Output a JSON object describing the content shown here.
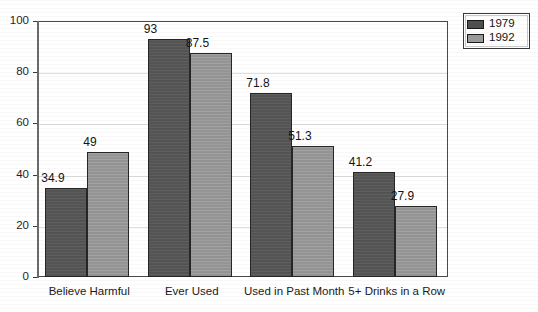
{
  "chart_data": {
    "type": "bar",
    "title": "",
    "subtitle": "",
    "xlabel": "",
    "ylabel": "",
    "ylim": [
      0,
      100
    ],
    "yticks": [
      0,
      20,
      40,
      60,
      80,
      100
    ],
    "ytick_labels": [
      "0",
      "20",
      "40",
      "60",
      "80",
      "100"
    ],
    "grid": true,
    "grid_axis": "y",
    "legend_position": "top-right",
    "categories": [
      "Believe Harmful",
      "Ever Used",
      "Used in Past Month",
      "5+ Drinks in a Row"
    ],
    "series": [
      {
        "name": "1979",
        "color": "#585858",
        "values": [
          34.9,
          93,
          71.8,
          41.2
        ],
        "value_labels": [
          "34.9",
          "93",
          "71.8",
          "41.2"
        ]
      },
      {
        "name": "1992",
        "color": "#9b9b9b",
        "values": [
          49,
          87.5,
          51.3,
          27.9
        ],
        "value_labels": [
          "49",
          "87.5",
          "51.3",
          "27.9"
        ]
      }
    ]
  },
  "legend": {
    "entries": [
      {
        "label": "1979",
        "color": "#4f4f4f"
      },
      {
        "label": "1992",
        "color": "#9b9b9b"
      }
    ]
  },
  "colors": {
    "series_1979": "#585858",
    "series_1992": "#9b9b9b",
    "gridline": "#dedede",
    "axis": "#4a4a4a",
    "text": "#1a1a1a",
    "background": "#ffffff"
  }
}
